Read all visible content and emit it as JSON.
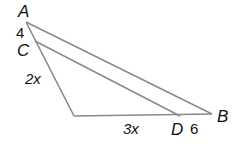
{
  "diagram": {
    "type": "geometry-triangle",
    "line_color": "#8a8a8a",
    "text_color": "#111111",
    "points": {
      "A": {
        "label": "A",
        "x": 26,
        "y": 22
      },
      "C": {
        "label": "C",
        "x": 35,
        "y": 41
      },
      "E": {
        "label": "",
        "x": 74,
        "y": 116
      },
      "D": {
        "label": "D",
        "x": 180,
        "y": 116
      },
      "B": {
        "label": "B",
        "x": 212,
        "y": 114
      }
    },
    "segment_labels": {
      "AC": "4",
      "CE": "2x",
      "ED": "3x",
      "DB": "6"
    }
  }
}
